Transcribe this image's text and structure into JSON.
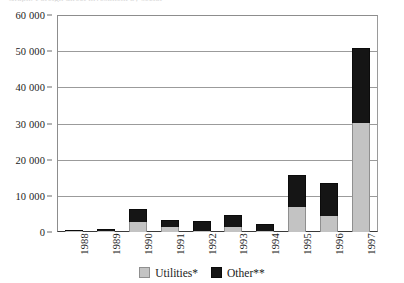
{
  "title_sliver": "Graph: Foreign direct investment by sector",
  "chart_data": {
    "type": "bar",
    "subtype": "stacked-vertical",
    "title": "",
    "xlabel": "",
    "ylabel": "",
    "categories": [
      "1988",
      "1989",
      "1990",
      "1991",
      "1992",
      "1993",
      "1994",
      "1995",
      "1996",
      "1997"
    ],
    "series": [
      {
        "name": "Utilities*",
        "color": "#c3c3c3",
        "values": [
          100,
          200,
          2700,
          1300,
          200,
          1500,
          100,
          6800,
          4500,
          30200
        ]
      },
      {
        "name": "Other**",
        "color": "#151515",
        "values": [
          300,
          600,
          3700,
          1900,
          2800,
          3100,
          1900,
          9000,
          9000,
          20800
        ]
      }
    ],
    "totals": [
      400,
      800,
      6400,
      3200,
      3000,
      4600,
      2000,
      15800,
      13500,
      51000
    ],
    "ylim": [
      0,
      60000
    ],
    "ytick_step": 10000,
    "ytick_labels": [
      "0",
      "10 000",
      "20 000",
      "30 000",
      "40 000",
      "50 000",
      "60 000"
    ],
    "ytick_values": [
      0,
      10000,
      20000,
      30000,
      40000,
      50000,
      60000
    ],
    "grid": "horizontal",
    "legend_position": "bottom-center",
    "legend": [
      {
        "label": "Utilities*",
        "swatch": "utilities"
      },
      {
        "label": "Other**",
        "swatch": "other"
      }
    ]
  }
}
